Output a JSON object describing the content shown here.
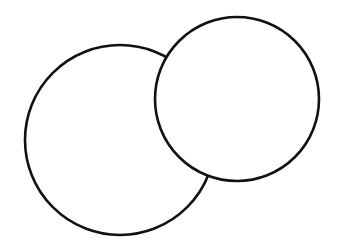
{
  "diagram": {
    "type": "overlapping-circles",
    "background": "#ffffff",
    "stroke_color": "#111111",
    "stroke_width": 2.6,
    "shapes": [
      {
        "name": "large-circle",
        "cx": 120,
        "cy": 140,
        "r": 95,
        "fill": "#ffffff",
        "z": 1
      },
      {
        "name": "small-circle",
        "cx": 237,
        "cy": 99,
        "r": 82,
        "fill": "#ffffff",
        "z": 2
      }
    ]
  }
}
